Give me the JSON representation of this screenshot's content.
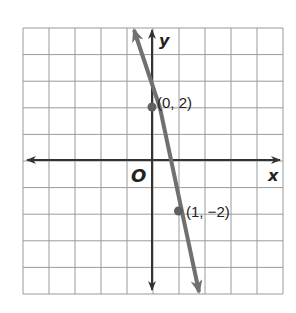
{
  "graph": {
    "x_axis_label": "x",
    "y_axis_label": "y",
    "origin_label": "O",
    "grid": {
      "columns": 10,
      "rows": 10,
      "x_range": [
        -5,
        5
      ],
      "y_range": [
        -5,
        5
      ]
    },
    "line": {
      "slope": -4,
      "intercept": 2,
      "color": "#707070"
    },
    "points": [
      {
        "label": "(0, 2)",
        "x": 0,
        "y": 2
      },
      {
        "label": "(1, −2)",
        "x": 1,
        "y": -2
      }
    ]
  }
}
